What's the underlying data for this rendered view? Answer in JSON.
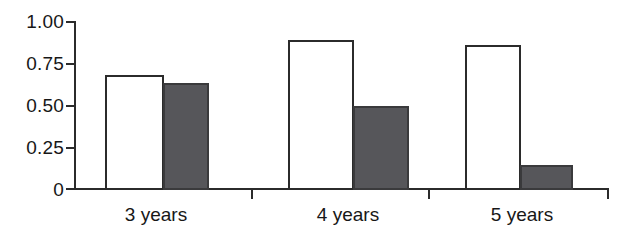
{
  "chart_data": {
    "type": "bar",
    "title": "",
    "subtitle": "",
    "xlabel": "",
    "ylabel": "",
    "categories": [
      "3 years",
      "4 years",
      "5 years"
    ],
    "series": [
      {
        "name": "open",
        "fill": "white",
        "values": [
          0.69,
          0.9,
          0.87
        ]
      },
      {
        "name": "filled",
        "fill": "dark-gray",
        "values": [
          0.64,
          0.5,
          0.15
        ]
      }
    ],
    "ylim": [
      0,
      1.0
    ],
    "yticks": [
      0,
      0.25,
      0.5,
      0.75,
      1.0
    ],
    "ytick_labels": [
      "0",
      "0.25",
      "0.50",
      "0.75",
      "1.00"
    ],
    "grid": false,
    "legend": "none",
    "bar_gap_within_group": 0,
    "colors": {
      "open_fill": "#ffffff",
      "open_stroke": "#2b2b2b",
      "filled_fill": "#56565a",
      "filled_stroke": "#3a3a3c",
      "axis": "#2b2b2b",
      "text": "#171717",
      "background": "#ffffff"
    }
  },
  "axis": {
    "y_labels": [
      {
        "text": "1.00",
        "value": 1.0
      },
      {
        "text": "0.75",
        "value": 0.75
      },
      {
        "text": "0.50",
        "value": 0.5
      },
      {
        "text": "0.25",
        "value": 0.25
      },
      {
        "text": "0",
        "value": 0
      }
    ]
  },
  "groups": [
    {
      "label": "3 years",
      "bars": [
        {
          "style": "open",
          "value": 0.69
        },
        {
          "style": "filled",
          "value": 0.64
        }
      ]
    },
    {
      "label": "4 years",
      "bars": [
        {
          "style": "open",
          "value": 0.9
        },
        {
          "style": "filled",
          "value": 0.5
        }
      ]
    },
    {
      "label": "5 years",
      "bars": [
        {
          "style": "open",
          "value": 0.87
        },
        {
          "style": "filled",
          "value": 0.15
        }
      ]
    }
  ]
}
